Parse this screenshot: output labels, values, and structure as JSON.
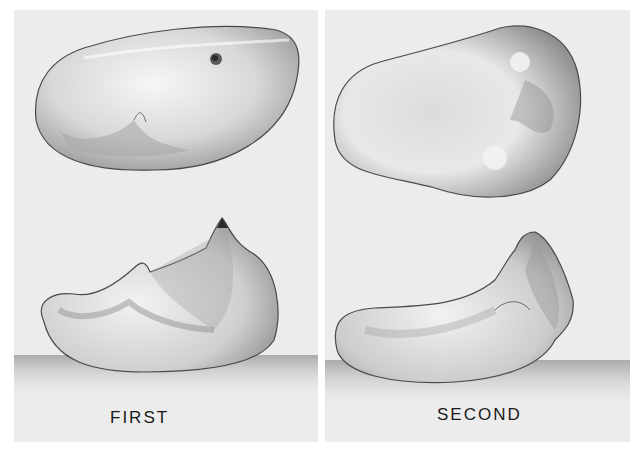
{
  "figure": {
    "panels": [
      {
        "id": "first",
        "label": "FIRST",
        "views": [
          "occlusal view",
          "lateral view"
        ]
      },
      {
        "id": "second",
        "label": "SECOND",
        "views": [
          "occlusal view",
          "lateral view"
        ]
      }
    ],
    "caption_fragment": ""
  },
  "colors": {
    "panel_bg": "#ececec",
    "tooth_light": "#f4f4f4",
    "tooth_mid": "#c8c8c8",
    "tooth_dark": "#7a7a7a",
    "outline": "#4a4a4a",
    "label": "#1a1a1a"
  }
}
